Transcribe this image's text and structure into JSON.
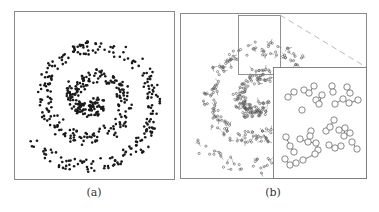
{
  "figure": {
    "panels": [
      {
        "id": "a",
        "label": "(a)",
        "description": "Spiral point cloud (dark dots)"
      },
      {
        "id": "b",
        "label": "(b)",
        "description": "Spiral point cloud with clustered nodes connected by edges, with a zoomed-in inset"
      }
    ]
  },
  "colors": {
    "frame": "#8a8a8a",
    "dot": "#1a1a1a",
    "node": "#555555",
    "dashed": "#aaaaaa"
  },
  "spiral": {
    "center_a": [
      92,
      100
    ],
    "center_b": [
      258,
      100
    ],
    "turns": 2.3,
    "max_radius": 68
  }
}
